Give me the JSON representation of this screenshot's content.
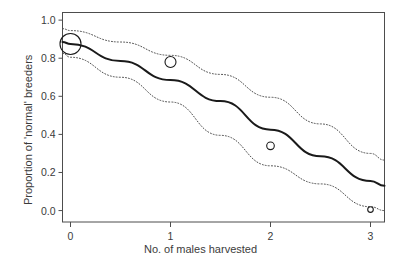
{
  "chart_data": {
    "type": "line",
    "title": "",
    "xlabel": "No. of males harvested",
    "ylabel": "Proportion of 'normal' breeders",
    "xlim": [
      -0.08,
      3.14
    ],
    "ylim": [
      -0.06,
      1.04
    ],
    "xticks": [
      0,
      1,
      2,
      3
    ],
    "xtick_labels": [
      "0",
      "1",
      "2",
      "3"
    ],
    "yticks": [
      0.0,
      0.2,
      0.4,
      0.6,
      0.8,
      1.0
    ],
    "ytick_labels": [
      "0.0",
      "0.2",
      "0.4",
      "0.6",
      "0.8",
      "1.0"
    ],
    "grid": false,
    "legend": "none",
    "series": [
      {
        "name": "fitted",
        "style": "solid",
        "color": "#1a1a1a",
        "x": [
          -0.08,
          0.0,
          0.5,
          1.0,
          1.5,
          2.0,
          2.5,
          3.0,
          3.14
        ],
        "values": [
          0.885,
          0.875,
          0.785,
          0.685,
          0.575,
          0.425,
          0.285,
          0.155,
          0.13
        ]
      },
      {
        "name": "upper confidence limit",
        "style": "dotted",
        "color": "#4d4d4d",
        "x": [
          -0.08,
          0.0,
          0.5,
          1.0,
          1.5,
          2.0,
          2.5,
          3.0,
          3.14
        ],
        "values": [
          0.955,
          0.945,
          0.885,
          0.815,
          0.715,
          0.595,
          0.455,
          0.3,
          0.265
        ]
      },
      {
        "name": "lower confidence limit",
        "style": "dotted",
        "color": "#4d4d4d",
        "x": [
          -0.08,
          0.0,
          0.5,
          1.0,
          1.5,
          2.0,
          2.5,
          3.0,
          3.14
        ],
        "values": [
          0.825,
          0.805,
          0.7,
          0.57,
          0.395,
          0.235,
          0.14,
          0.02,
          0.0
        ]
      }
    ],
    "points": [
      {
        "x": 0,
        "y": 0.875,
        "radius_px": 10.5
      },
      {
        "x": 1,
        "y": 0.78,
        "radius_px": 5.5
      },
      {
        "x": 2,
        "y": 0.34,
        "radius_px": 3.8
      },
      {
        "x": 3,
        "y": 0.005,
        "radius_px": 2.8
      }
    ],
    "point_marker": "open-circle",
    "point_color": "#1a1a1a",
    "frame_color": "#4d4d4d",
    "background": "#ffffff"
  },
  "axes": {
    "x_tick_labels": [
      "0",
      "1",
      "2",
      "3"
    ],
    "y_tick_labels": [
      "0.0",
      "0.2",
      "0.4",
      "0.6",
      "0.8",
      "1.0"
    ],
    "x_title": "No. of males harvested",
    "y_title": "Proportion of 'normal' breeders"
  }
}
